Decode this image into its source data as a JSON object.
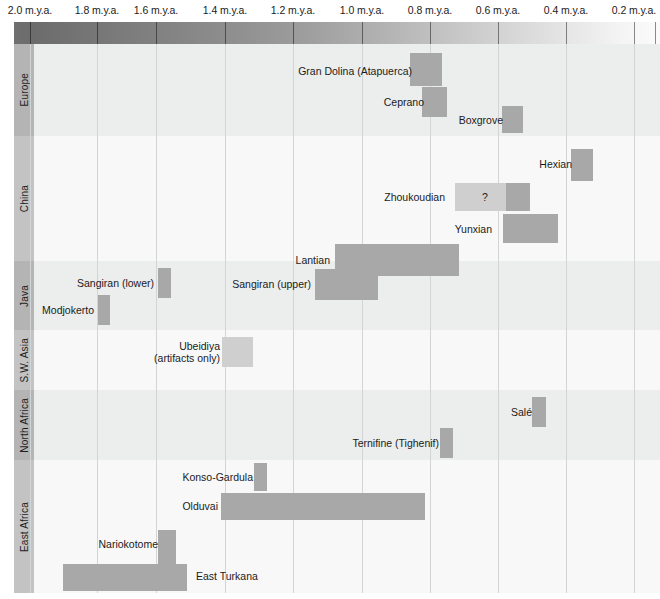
{
  "chart_data": {
    "type": "bar",
    "orientation": "horizontal-timeline",
    "title": "",
    "xlabel": "",
    "ylabel": "",
    "xlim": [
      2.1,
      0.05
    ],
    "x_unit": "m.y.a.",
    "x_direction": "older-to-younger (left to right)",
    "grid": true,
    "legend": null,
    "axis": {
      "ticks": [
        {
          "label": "2.0 m.y.a.",
          "value": 2.0,
          "x": 30
        },
        {
          "label": "1.8 m.y.a.",
          "value": 1.8,
          "x": 97
        },
        {
          "label": "1.6 m.y.a.",
          "value": 1.6,
          "x": 156
        },
        {
          "label": "1.4 m.y.a.",
          "value": 1.4,
          "x": 225
        },
        {
          "label": "1.2 m.y.a.",
          "value": 1.2,
          "x": 293
        },
        {
          "label": "1.0 m.y.a.",
          "value": 1.0,
          "x": 362
        },
        {
          "label": "0.8 m.y.a.",
          "value": 0.8,
          "x": 430
        },
        {
          "label": "0.6 m.y.a.",
          "value": 0.6,
          "x": 498
        },
        {
          "label": "0.4 m.y.a.",
          "value": 0.4,
          "x": 566
        },
        {
          "label": "0.2 m.y.a.",
          "value": 0.2,
          "x": 634
        }
      ]
    },
    "regions": [
      {
        "name": "Europe",
        "band": "shade-a",
        "label_shade": "lbl-a",
        "top": 0,
        "height": 92,
        "sites": [
          {
            "name": "Gran Dolina (Atapuerca)",
            "label": "Gran Dolina (Atapuerca)",
            "label_lines": [
              "Gran Dolina (Atapuerca)"
            ],
            "start_mya": 0.86,
            "end_mya": 0.78,
            "bar_x": 410,
            "bar_width": 32,
            "bar_y": 9,
            "bar_height": 33,
            "label_right": 248,
            "label_top": 21,
            "segments": [
              {
                "type": "solid",
                "left": 0,
                "width": 32
              }
            ]
          },
          {
            "name": "Ceprano",
            "label": "Ceprano",
            "label_lines": [
              "Ceprano"
            ],
            "start_mya": 0.82,
            "end_mya": 0.75,
            "bar_x": 422,
            "bar_width": 25,
            "bar_y": 43,
            "bar_height": 30,
            "label_right": 236,
            "label_top": 52,
            "segments": [
              {
                "type": "solid",
                "left": 0,
                "width": 25
              }
            ]
          },
          {
            "name": "Boxgrove",
            "label": "Boxgrove",
            "label_lines": [
              "Boxgrove"
            ],
            "start_mya": 0.58,
            "end_mya": 0.52,
            "bar_x": 502,
            "bar_width": 21,
            "bar_y": 62,
            "bar_height": 27,
            "label_right": 157,
            "label_top": 70,
            "segments": [
              {
                "type": "solid",
                "left": 0,
                "width": 21
              }
            ]
          }
        ]
      },
      {
        "name": "China",
        "band": "shade-b",
        "label_shade": "lbl-b",
        "top": 92,
        "height": 125,
        "sites": [
          {
            "name": "Hexian",
            "label": "Hexian",
            "label_lines": [
              "Hexian"
            ],
            "start_mya": 0.29,
            "end_mya": 0.22,
            "bar_x": 571,
            "bar_width": 22,
            "bar_y": 13,
            "bar_height": 32,
            "label_right": 88,
            "label_top": 22,
            "segments": [
              {
                "type": "solid",
                "left": 0,
                "width": 22
              }
            ]
          },
          {
            "name": "Zhoukoudian",
            "label": "Zhoukoudian",
            "label_lines": [
              "Zhoukoudian"
            ],
            "start_mya": 0.64,
            "end_mya": 0.42,
            "bar_x": 455,
            "bar_width": 75,
            "bar_y": 47,
            "bar_height": 28,
            "label_right": 215,
            "label_top": 55,
            "uncertain_marker": "?",
            "uncertain_marker_x": 30,
            "segments": [
              {
                "type": "uncertain",
                "left": 0,
                "width": 51
              },
              {
                "type": "solid",
                "left": 51,
                "width": 24
              }
            ]
          },
          {
            "name": "Yunxian",
            "label": "Yunxian",
            "label_lines": [
              "Yunxian"
            ],
            "start_mya": 0.58,
            "end_mya": 0.4,
            "bar_x": 503,
            "bar_width": 55,
            "bar_y": 78,
            "bar_height": 29,
            "label_right": 168,
            "label_top": 87,
            "segments": [
              {
                "type": "solid",
                "left": 0,
                "width": 55
              }
            ]
          },
          {
            "name": "Lantian",
            "label": "Lantian",
            "label_lines": [
              "Lantian"
            ],
            "start_mya": 1.15,
            "end_mya": 0.6,
            "bar_x": 335,
            "bar_width": 124,
            "bar_y": 108,
            "bar_height": 32,
            "label_right": 330,
            "label_top": 118,
            "segments": [
              {
                "type": "solid",
                "left": 0,
                "width": 124
              }
            ]
          }
        ]
      },
      {
        "name": "Java",
        "band": "shade-a",
        "label_shade": "lbl-a",
        "top": 217,
        "height": 69,
        "sites": [
          {
            "name": "Sangiran (lower)",
            "label": "Sangiran (lower)",
            "label_lines": [
              "Sangiran (lower)"
            ],
            "start_mya": 1.62,
            "end_mya": 1.58,
            "bar_x": 158,
            "bar_width": 13,
            "bar_y": 7,
            "bar_height": 30,
            "label_right": 506,
            "label_top": 16,
            "segments": [
              {
                "type": "solid",
                "left": 0,
                "width": 13
              }
            ]
          },
          {
            "name": "Sangiran (upper)",
            "label": "Sangiran (upper)",
            "label_lines": [
              "Sangiran (upper)"
            ],
            "start_mya": 1.26,
            "end_mya": 1.07,
            "bar_x": 315,
            "bar_width": 63,
            "bar_y": 8,
            "bar_height": 31,
            "label_right": 349,
            "label_top": 17,
            "segments": [
              {
                "type": "solid",
                "left": 0,
                "width": 63
              }
            ]
          },
          {
            "name": "Modjokerto",
            "label": "Modjokerto",
            "label_lines": [
              "Modjokerto"
            ],
            "start_mya": 1.81,
            "end_mya": 1.78,
            "bar_x": 98,
            "bar_width": 12,
            "bar_y": 34,
            "bar_height": 30,
            "label_right": 566,
            "label_top": 43,
            "segments": [
              {
                "type": "solid",
                "left": 0,
                "width": 12
              }
            ]
          }
        ]
      },
      {
        "name": "S.W. Asia",
        "band": "shade-b",
        "label_shade": "lbl-b",
        "top": 286,
        "height": 60,
        "sites": [
          {
            "name": "Ubeidiya (artifacts only)",
            "label": "Ubeidiya (artifacts only)",
            "label_lines": [
              "Ubeidiya",
              "(artifacts only)"
            ],
            "start_mya": 1.41,
            "end_mya": 1.32,
            "bar_x": 222,
            "bar_width": 31,
            "bar_y": 7,
            "bar_height": 30,
            "label_right": 440,
            "label_top": 10,
            "segments": [
              {
                "type": "uncertain",
                "left": 0,
                "width": 31
              }
            ]
          }
        ]
      },
      {
        "name": "North Africa",
        "band": "shade-a",
        "label_shade": "lbl-a",
        "top": 346,
        "height": 70,
        "sites": [
          {
            "name": "Sale",
            "label": "Salé",
            "label_lines": [
              "Salé"
            ],
            "start_mya": 0.42,
            "end_mya": 0.38,
            "bar_x": 532,
            "bar_width": 14,
            "bar_y": 7,
            "bar_height": 30,
            "label_right": 128,
            "label_top": 16,
            "segments": [
              {
                "type": "solid",
                "left": 0,
                "width": 14
              }
            ]
          },
          {
            "name": "Ternifine (Tighenif)",
            "label": "Ternifine (Tighenif)",
            "label_lines": [
              "Ternifine (Tighenif)"
            ],
            "start_mya": 0.72,
            "end_mya": 0.68,
            "bar_x": 440,
            "bar_width": 13,
            "bar_y": 38,
            "bar_height": 30,
            "label_right": 221,
            "label_top": 47,
            "segments": [
              {
                "type": "solid",
                "left": 0,
                "width": 13
              }
            ]
          }
        ]
      },
      {
        "name": "East Africa",
        "band": "shade-b",
        "label_shade": "lbl-b",
        "top": 416,
        "height": 133,
        "sites": [
          {
            "name": "Konso-Gardula",
            "label": "Konso-Gardula",
            "label_lines": [
              "Konso-Gardula"
            ],
            "start_mya": 1.4,
            "end_mya": 1.36,
            "bar_x": 254,
            "bar_width": 13,
            "bar_y": 3,
            "bar_height": 28,
            "label_right": 407,
            "label_top": 11,
            "segments": [
              {
                "type": "solid",
                "left": 0,
                "width": 13
              }
            ]
          },
          {
            "name": "Olduvai",
            "label": "Olduvai",
            "label_lines": [
              "Olduvai"
            ],
            "start_mya": 1.5,
            "end_mya": 0.9,
            "bar_x": 221,
            "bar_width": 204,
            "bar_y": 33,
            "bar_height": 27,
            "label_right": 442,
            "label_top": 40,
            "segments": [
              {
                "type": "solid",
                "left": 0,
                "width": 204
              }
            ]
          },
          {
            "name": "Nariokotome",
            "label": "Nariokotome",
            "label_lines": [
              "Nariokotome"
            ],
            "start_mya": 1.61,
            "end_mya": 1.56,
            "bar_x": 158,
            "bar_width": 18,
            "bar_y": 70,
            "bar_height": 34,
            "label_right": 502,
            "label_top": 78,
            "segments": [
              {
                "type": "solid",
                "left": 0,
                "width": 18
              }
            ]
          },
          {
            "name": "East Turkana",
            "label": "East Turkana",
            "label_lines": [
              "East Turkana"
            ],
            "start_mya": 1.91,
            "end_mya": 1.55,
            "bar_x": 63,
            "bar_width": 124,
            "bar_y": 104,
            "bar_height": 27,
            "label_left": 196,
            "label_top": 110,
            "segments": [
              {
                "type": "solid",
                "left": 0,
                "width": 124
              }
            ]
          }
        ]
      }
    ],
    "colors": {
      "bar_solid": "#a8a8a8",
      "bar_uncertain": "#cfcfcf",
      "band_shade_a": "#eceded",
      "band_shade_b": "#f8f8f8",
      "region_label_a": "#b4b4b4",
      "region_label_b": "#c3c3c3",
      "gridline": "#d2d4d6",
      "text": "#1b1b1b",
      "gradient_old": "#6f6f6f",
      "gradient_recent": "#fbfbfb"
    }
  }
}
